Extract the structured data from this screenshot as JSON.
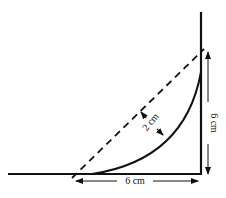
{
  "diagram": {
    "colors": {
      "line": "#111111",
      "background": "#ffffff"
    },
    "labels": {
      "bottom_dimension": "6 cm",
      "right_dimension": "6 cm",
      "sag_dimension": "2 cm"
    },
    "elements": {
      "horizontal_line": "ground-line",
      "vertical_line": "wall-line",
      "dashed_line": "straight-chord",
      "curve": "sagging-curve"
    }
  }
}
